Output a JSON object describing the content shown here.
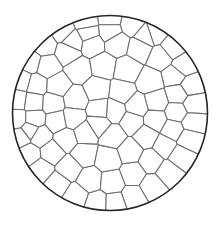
{
  "figure": {
    "background_color": "#ffffff",
    "canvas": {
      "width": 220,
      "height": 226
    }
  },
  "boundary": {
    "name": "circle",
    "center_x": 110,
    "center_y": 113,
    "radius": 97.5,
    "stroke_color": "#262626",
    "stroke_width": 1.6,
    "fill_color": "#ffffff"
  },
  "cells": {
    "edge_stroke_color": "#6e6e6e",
    "edge_stroke_width": 1.05,
    "face_fill_color": "#ffffff",
    "count": 78,
    "clip_jitter": 0.0,
    "seed_points": [
      [
        110.0,
        18.5
      ],
      [
        86.0,
        22.0
      ],
      [
        132.0,
        24.0
      ],
      [
        63.0,
        31.0
      ],
      [
        155.0,
        33.0
      ],
      [
        44.0,
        45.0
      ],
      [
        172.0,
        48.0
      ],
      [
        31.0,
        62.0
      ],
      [
        183.0,
        66.0
      ],
      [
        22.0,
        81.0
      ],
      [
        190.0,
        86.0
      ],
      [
        18.0,
        100.0
      ],
      [
        193.0,
        104.0
      ],
      [
        17.5,
        119.0
      ],
      [
        192.0,
        122.0
      ],
      [
        21.0,
        137.0
      ],
      [
        188.0,
        139.0
      ],
      [
        29.0,
        154.0
      ],
      [
        180.0,
        156.0
      ],
      [
        41.0,
        170.0
      ],
      [
        168.0,
        172.0
      ],
      [
        57.0,
        184.0
      ],
      [
        152.0,
        186.0
      ],
      [
        76.0,
        196.0
      ],
      [
        133.0,
        197.0
      ],
      [
        97.0,
        203.0
      ],
      [
        115.0,
        203.5
      ],
      [
        92.0,
        44.0
      ],
      [
        117.0,
        43.0
      ],
      [
        140.0,
        48.0
      ],
      [
        68.0,
        52.0
      ],
      [
        161.0,
        57.0
      ],
      [
        47.0,
        66.0
      ],
      [
        175.0,
        76.0
      ],
      [
        36.0,
        85.0
      ],
      [
        178.0,
        94.0
      ],
      [
        33.0,
        102.0
      ],
      [
        177.0,
        112.0
      ],
      [
        34.0,
        119.0
      ],
      [
        173.0,
        130.0
      ],
      [
        40.0,
        136.0
      ],
      [
        165.0,
        146.0
      ],
      [
        52.0,
        152.0
      ],
      [
        151.0,
        161.0
      ],
      [
        69.0,
        168.0
      ],
      [
        133.0,
        174.0
      ],
      [
        90.0,
        180.0
      ],
      [
        112.0,
        182.0
      ],
      [
        79.0,
        70.0
      ],
      [
        103.0,
        66.0
      ],
      [
        127.0,
        70.0
      ],
      [
        150.0,
        82.0
      ],
      [
        58.0,
        86.0
      ],
      [
        156.0,
        101.0
      ],
      [
        53.0,
        103.0
      ],
      [
        155.0,
        120.0
      ],
      [
        57.0,
        121.0
      ],
      [
        146.0,
        136.0
      ],
      [
        66.0,
        139.0
      ],
      [
        130.0,
        151.0
      ],
      [
        84.0,
        154.0
      ],
      [
        108.0,
        159.0
      ],
      [
        97.0,
        89.0
      ],
      [
        122.0,
        92.0
      ],
      [
        75.0,
        99.0
      ],
      [
        137.0,
        106.0
      ],
      [
        73.0,
        118.0
      ],
      [
        132.0,
        122.0
      ],
      [
        85.0,
        133.0
      ],
      [
        113.0,
        136.0
      ],
      [
        100.0,
        110.0
      ],
      [
        114.0,
        111.0
      ],
      [
        99.0,
        124.0
      ],
      [
        110.0,
        31.0
      ],
      [
        88.0,
        33.0
      ],
      [
        73.0,
        41.0
      ],
      [
        146.0,
        36.0
      ],
      [
        30.0,
        130.0
      ]
    ]
  },
  "legend": {
    "visible": false,
    "entries": []
  },
  "axes": {
    "visible": false,
    "x_label": "",
    "y_label": "",
    "tick_labels": []
  }
}
